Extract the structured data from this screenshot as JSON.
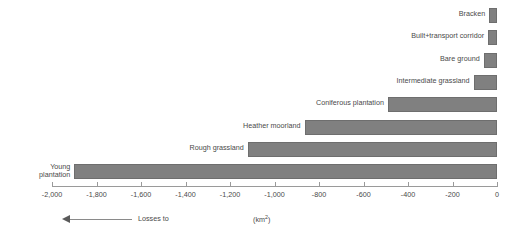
{
  "chart_data": {
    "type": "bar",
    "orientation": "horizontal",
    "title": "",
    "xlabel": "(km2)",
    "ylabel": "",
    "xlim": [
      -2000,
      0
    ],
    "grid": false,
    "legend": null,
    "tick_labels": [
      "-2,000",
      "-1,800",
      "-1,600",
      "-1,400",
      "-1,200",
      "-1,000",
      "-800",
      "-600",
      "-400",
      "-200",
      "0"
    ],
    "tick_values": [
      -2000,
      -1800,
      -1600,
      -1400,
      -1200,
      -1000,
      -800,
      -600,
      -400,
      -200,
      0
    ],
    "categories": [
      "Bracken",
      "Built+transport corridor",
      "Bare ground",
      "Intermediate grassland",
      "Coniferous plantation",
      "Heather moorland",
      "Rough grassland",
      "Young plantation"
    ],
    "values": [
      -35,
      -40,
      -60,
      -105,
      -490,
      -865,
      -1120,
      -1900
    ],
    "bar_color": "#808080",
    "annotations": {
      "direction_note": "Losses to",
      "unit": "(km2)"
    }
  },
  "axis": {
    "unit_text_prefix": "(km",
    "unit_text_sup": "2",
    "unit_text_suffix": ")"
  },
  "footer": {
    "losses_label": "Losses to"
  },
  "bars": [
    {
      "label": "Bracken",
      "value": -35,
      "label_line1": "Bracken"
    },
    {
      "label": "Built+transport corridor",
      "value": -40,
      "label_line1": "Built+transport corridor"
    },
    {
      "label": "Bare ground",
      "value": -60,
      "label_line1": "Bare ground"
    },
    {
      "label": "Intermediate grassland",
      "value": -105,
      "label_line1": "Intermediate grassland"
    },
    {
      "label": "Coniferous plantation",
      "value": -490,
      "label_line1": "Coniferous plantation"
    },
    {
      "label": "Heather moorland",
      "value": -865,
      "label_line1": "Heather moorland"
    },
    {
      "label": "Rough grassland",
      "value": -1120,
      "label_line1": "Rough grassland"
    },
    {
      "label": "Young plantation",
      "value": -1900,
      "label_line1": "Young",
      "label_line2": "plantation"
    }
  ],
  "ticks": [
    {
      "label": "-2,000",
      "value": -2000
    },
    {
      "label": "-1,800",
      "value": -1800
    },
    {
      "label": "-1,600",
      "value": -1600
    },
    {
      "label": "-1,400",
      "value": -1400
    },
    {
      "label": "-1,200",
      "value": -1200
    },
    {
      "label": "-1,000",
      "value": -1000
    },
    {
      "label": "-800",
      "value": -800
    },
    {
      "label": "-600",
      "value": -600
    },
    {
      "label": "-400",
      "value": -400
    },
    {
      "label": "-200",
      "value": -200
    },
    {
      "label": "0",
      "value": 0
    }
  ]
}
